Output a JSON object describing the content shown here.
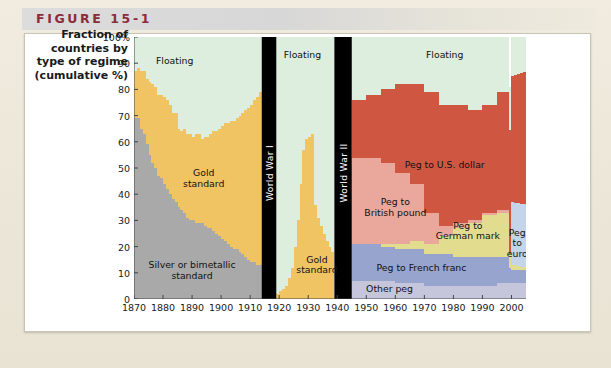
{
  "figure": {
    "label": "FIGURE 15-1",
    "accent_color": "#8c2c3b"
  },
  "y_axis_caption": [
    "Fraction of",
    "countries by",
    "type of regime",
    "(cumulative %)"
  ],
  "chart_data": {
    "type": "area",
    "title": "",
    "subtitle": "",
    "xlabel": "",
    "ylabel": "Fraction of countries by type of regime (cumulative %)",
    "xlim": [
      1870,
      2005
    ],
    "ylim": [
      0,
      100
    ],
    "grid": false,
    "legend_position": "in-plot annotations",
    "y_ticks": [
      "0",
      "10",
      "20",
      "30",
      "40",
      "50",
      "60",
      "70",
      "80",
      "90",
      "100%"
    ],
    "y_tick_values": [
      0,
      10,
      20,
      30,
      40,
      50,
      60,
      70,
      80,
      90,
      100
    ],
    "x_ticks": [
      "1870",
      "1880",
      "1890",
      "1900",
      "1910",
      "1920",
      "1930",
      "1940",
      "1950",
      "1960",
      "1970",
      "1980",
      "1990",
      "2000"
    ],
    "x_tick_values": [
      1870,
      1880,
      1890,
      1900,
      1910,
      1920,
      1930,
      1940,
      1950,
      1960,
      1970,
      1980,
      1990,
      2000
    ],
    "colors": {
      "floating": "#ddeede",
      "gold_standard": "#f0c463",
      "silver_bimetallic": "#a9a9a9",
      "peg_us_dollar": "#cf5742",
      "peg_british_pound": "#eaa79c",
      "peg_german_mark": "#e2dd8e",
      "peg_french_franc": "#97a4cd",
      "other_peg": "#c5c5dc",
      "peg_euro": "#c4d5e9",
      "war_band": "#000000"
    },
    "annotations": [
      {
        "text": "Floating",
        "x": 1884,
        "y": 91,
        "series": "floating"
      },
      {
        "text": "Gold\nstandard",
        "x": 1894,
        "y": 46,
        "series": "gold_standard"
      },
      {
        "text": "Silver or bimetallic\nstandard",
        "x": 1890,
        "y": 11,
        "series": "silver_bimetallic"
      },
      {
        "text": "Floating",
        "x": 1928,
        "y": 93,
        "series": "floating"
      },
      {
        "text": "Gold\nstandard",
        "x": 1933,
        "y": 13,
        "series": "gold_standard"
      },
      {
        "text": "Floating",
        "x": 1977,
        "y": 93,
        "series": "floating"
      },
      {
        "text": "Peg to U.S. dollar",
        "x": 1977,
        "y": 51,
        "series": "peg_us_dollar"
      },
      {
        "text": "Peg to\nBritish pound",
        "x": 1960,
        "y": 35,
        "series": "peg_british_pound"
      },
      {
        "text": "Peg to\nGerman mark",
        "x": 1985,
        "y": 26,
        "series": "peg_german_mark"
      },
      {
        "text": "Peg to French franc",
        "x": 1969,
        "y": 12,
        "series": "peg_french_franc"
      },
      {
        "text": "Other peg",
        "x": 1958,
        "y": 4,
        "series": "other_peg"
      },
      {
        "text": "Peg\nto\neuro",
        "x": 2002,
        "y": 21,
        "series": "peg_euro"
      }
    ],
    "war_bands": [
      {
        "label": "World War I",
        "start": 1914,
        "end": 1919
      },
      {
        "label": "World War II",
        "start": 1939,
        "end": 1945
      }
    ],
    "series": [
      {
        "name": "Silver or bimetallic standard",
        "key": "silver_bimetallic",
        "color": "#a9a9a9",
        "x": [
          1870,
          1871,
          1872,
          1873,
          1874,
          1875,
          1876,
          1877,
          1878,
          1879,
          1880,
          1881,
          1882,
          1883,
          1884,
          1885,
          1886,
          1887,
          1888,
          1889,
          1890,
          1891,
          1892,
          1893,
          1894,
          1895,
          1896,
          1897,
          1898,
          1899,
          1900,
          1901,
          1902,
          1903,
          1904,
          1905,
          1906,
          1907,
          1908,
          1909,
          1910,
          1911,
          1912,
          1913,
          1914
        ],
        "values": [
          69,
          69,
          65,
          63,
          59,
          55,
          52,
          50,
          47,
          46,
          44,
          42,
          40,
          38,
          37,
          35,
          34,
          33,
          31,
          30,
          30,
          29,
          29,
          29,
          28,
          27,
          27,
          26,
          25,
          24,
          23,
          22,
          21,
          20,
          19,
          19,
          18,
          17,
          16,
          15,
          14,
          14,
          13,
          13,
          13
        ]
      },
      {
        "name": "Gold standard",
        "key": "gold_standard",
        "color": "#f0c463",
        "x": [
          1870,
          1871,
          1872,
          1873,
          1874,
          1875,
          1876,
          1877,
          1878,
          1879,
          1880,
          1881,
          1882,
          1883,
          1884,
          1885,
          1886,
          1887,
          1888,
          1889,
          1890,
          1891,
          1892,
          1893,
          1894,
          1895,
          1896,
          1897,
          1898,
          1899,
          1900,
          1901,
          1902,
          1903,
          1904,
          1905,
          1906,
          1907,
          1908,
          1909,
          1910,
          1911,
          1912,
          1913,
          1914
        ],
        "values": [
          18,
          19,
          22,
          24,
          25,
          28,
          30,
          31,
          31,
          32,
          33,
          34,
          34,
          33,
          34,
          30,
          30,
          32,
          32,
          33,
          32,
          34,
          34,
          32,
          34,
          35,
          36,
          38,
          39,
          41,
          43,
          45,
          46,
          48,
          49,
          50,
          52,
          54,
          56,
          58,
          60,
          62,
          64,
          66,
          68
        ]
      },
      {
        "name": "Floating",
        "key": "floating",
        "color": "#ddeede",
        "x": [
          1870,
          1871,
          1872,
          1873,
          1874,
          1875,
          1876,
          1877,
          1878,
          1879,
          1880,
          1881,
          1882,
          1883,
          1884,
          1885,
          1886,
          1887,
          1888,
          1889,
          1890,
          1891,
          1892,
          1893,
          1894,
          1895,
          1896,
          1897,
          1898,
          1899,
          1900,
          1901,
          1902,
          1903,
          1904,
          1905,
          1906,
          1907,
          1908,
          1909,
          1910,
          1911,
          1912,
          1913,
          1914
        ],
        "values": [
          13,
          12,
          13,
          13,
          16,
          17,
          18,
          19,
          22,
          22,
          23,
          24,
          26,
          29,
          29,
          35,
          36,
          35,
          37,
          37,
          38,
          37,
          37,
          39,
          38,
          38,
          37,
          36,
          36,
          35,
          34,
          33,
          33,
          32,
          32,
          31,
          30,
          29,
          28,
          27,
          26,
          24,
          23,
          21,
          19
        ]
      },
      {
        "name": "Gold standard (interwar)",
        "key": "gold_standard",
        "color": "#f0c463",
        "x": [
          1919,
          1920,
          1921,
          1922,
          1923,
          1924,
          1925,
          1926,
          1927,
          1928,
          1929,
          1930,
          1931,
          1932,
          1933,
          1934,
          1935,
          1936,
          1937,
          1938,
          1939
        ],
        "values": [
          2,
          3,
          4,
          5,
          8,
          12,
          20,
          30,
          44,
          57,
          61,
          62,
          63,
          36,
          31,
          28,
          25,
          22,
          20,
          18,
          16
        ]
      },
      {
        "name": "Floating (interwar)",
        "key": "floating",
        "color": "#ddeede",
        "x": [
          1919,
          1920,
          1921,
          1922,
          1923,
          1924,
          1925,
          1926,
          1927,
          1928,
          1929,
          1930,
          1931,
          1932,
          1933,
          1934,
          1935,
          1936,
          1937,
          1938,
          1939
        ],
        "values": [
          98,
          97,
          96,
          95,
          92,
          88,
          80,
          70,
          56,
          43,
          39,
          38,
          37,
          64,
          69,
          72,
          75,
          78,
          80,
          82,
          84
        ]
      },
      {
        "name": "Other peg",
        "key": "other_peg",
        "color": "#c5c5dc",
        "x": [
          1945,
          1950,
          1955,
          1960,
          1965,
          1970,
          1975,
          1980,
          1985,
          1990,
          1995,
          2000,
          2005
        ],
        "values": [
          7,
          7,
          7,
          6,
          6,
          5,
          5,
          5,
          5,
          5,
          6,
          6,
          6
        ]
      },
      {
        "name": "Peg to French franc",
        "key": "peg_french_franc",
        "color": "#97a4cd",
        "x": [
          1945,
          1950,
          1955,
          1960,
          1965,
          1970,
          1975,
          1980,
          1985,
          1990,
          1995,
          2000,
          2005
        ],
        "values": [
          14,
          14,
          13,
          13,
          13,
          12,
          12,
          11,
          11,
          11,
          10,
          5,
          5
        ]
      },
      {
        "name": "Peg to German mark",
        "key": "peg_german_mark",
        "color": "#e2dd8e",
        "x": [
          1945,
          1950,
          1955,
          1960,
          1965,
          1970,
          1975,
          1980,
          1985,
          1990,
          1995,
          2000,
          2005
        ],
        "values": [
          0,
          0,
          1,
          2,
          3,
          4,
          7,
          11,
          13,
          16,
          17,
          2,
          1
        ]
      },
      {
        "name": "Peg to euro",
        "key": "peg_euro",
        "color": "#c4d5e9",
        "x": [
          1999,
          2000,
          2001,
          2002,
          2003,
          2004,
          2005
        ],
        "values": [
          0,
          24,
          24,
          24,
          24,
          24,
          24
        ]
      },
      {
        "name": "Peg to British pound",
        "key": "peg_british_pound",
        "color": "#eaa79c",
        "x": [
          1945,
          1950,
          1955,
          1960,
          1965,
          1970,
          1975,
          1980,
          1985,
          1990,
          1995,
          2000,
          2005
        ],
        "values": [
          33,
          33,
          31,
          27,
          22,
          12,
          4,
          2,
          1,
          1,
          1,
          0,
          0
        ]
      },
      {
        "name": "Peg to U.S. dollar",
        "key": "peg_us_dollar",
        "color": "#cf5742",
        "x": [
          1945,
          1950,
          1955,
          1960,
          1965,
          1970,
          1975,
          1980,
          1985,
          1990,
          1995,
          2000,
          2005
        ],
        "values": [
          22,
          24,
          28,
          34,
          38,
          46,
          46,
          45,
          42,
          41,
          45,
          48,
          51
        ]
      },
      {
        "name": "Floating (postwar)",
        "key": "floating",
        "color": "#ddeede",
        "x": [
          1945,
          1950,
          1955,
          1960,
          1965,
          1970,
          1975,
          1980,
          1985,
          1990,
          1995,
          2000,
          2005
        ],
        "values": [
          24,
          22,
          20,
          18,
          18,
          21,
          26,
          26,
          28,
          26,
          21,
          15,
          13
        ]
      }
    ]
  },
  "bottom_caption": ""
}
